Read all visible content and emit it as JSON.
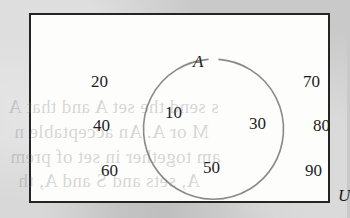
{
  "diagram": {
    "type": "venn-diagram",
    "title": "",
    "universal_set": {
      "label": "U",
      "name": "universal-set"
    },
    "sets": [
      {
        "label": "A",
        "name": "set-a",
        "shape": "circle",
        "members": [
          "10",
          "30",
          "50"
        ]
      }
    ],
    "elements": [
      {
        "id": "elem-20",
        "value": "20",
        "region": "outside-a",
        "column": "left"
      },
      {
        "id": "elem-40",
        "value": "40",
        "region": "outside-a",
        "column": "left"
      },
      {
        "id": "elem-60",
        "value": "60",
        "region": "outside-a",
        "column": "left"
      },
      {
        "id": "elem-70",
        "value": "70",
        "region": "outside-a",
        "column": "right"
      },
      {
        "id": "elem-80",
        "value": "80",
        "region": "outside-a",
        "column": "right"
      },
      {
        "id": "elem-90",
        "value": "90",
        "region": "outside-a",
        "column": "right"
      },
      {
        "id": "elem-10",
        "value": "10",
        "region": "inside-a",
        "column": "center"
      },
      {
        "id": "elem-30",
        "value": "30",
        "region": "inside-a",
        "column": "center"
      },
      {
        "id": "elem-50",
        "value": "50",
        "region": "inside-a",
        "column": "center"
      }
    ],
    "values": {
      "e20": "20",
      "e40": "40",
      "e60": "60",
      "e70": "70",
      "e80": "80",
      "e90": "90",
      "e10": "10",
      "e30": "30",
      "e50": "50"
    },
    "colors": {
      "page_background": "#c9c9c9",
      "box_fill": "#fdfdfc",
      "box_border": "#242424",
      "circle_stroke": "#8a8a8a",
      "text": "#1c1c1c"
    }
  },
  "bleed_through": {
    "line1": "s send the set A and that A",
    "line2": "M or A. An acceptable n",
    "line3": "am together in set of prem",
    "line4": "A, sets and S and A, th"
  }
}
